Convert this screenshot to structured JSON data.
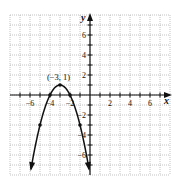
{
  "chart_data": {
    "type": "line",
    "title": "",
    "xlabel": "x",
    "ylabel": "y",
    "xlim": [
      -8,
      8
    ],
    "ylim": [
      -8,
      8
    ],
    "grid": true,
    "x_ticks": [
      -6,
      -4,
      -2,
      2,
      4,
      6
    ],
    "y_ticks": [
      -6,
      -4,
      -2,
      2,
      4,
      6
    ],
    "x_tick_labels": [
      "-6",
      "-4",
      "-2",
      "2",
      "4",
      "6"
    ],
    "y_tick_labels": [
      "-6",
      "-4",
      "-2",
      "2",
      "4",
      "6"
    ],
    "series": [
      {
        "name": "parabola",
        "equation": "y = -(x + 3)^2 + 1",
        "points": [
          {
            "x": -5,
            "y": -3
          },
          {
            "x": -4,
            "y": 0
          },
          {
            "x": -3,
            "y": 1
          },
          {
            "x": -2,
            "y": 0
          },
          {
            "x": -1,
            "y": -3
          }
        ],
        "arrow_ends": [
          {
            "x": -5.9,
            "y": -7.4
          },
          {
            "x": -0.1,
            "y": -7.4
          }
        ]
      }
    ],
    "annotations": [
      {
        "text": "(-3, 1)",
        "x": -3,
        "y": 1
      }
    ]
  },
  "labels": {
    "x_axis": "x",
    "y_axis": "y",
    "vertex": "(−3, 1)"
  }
}
